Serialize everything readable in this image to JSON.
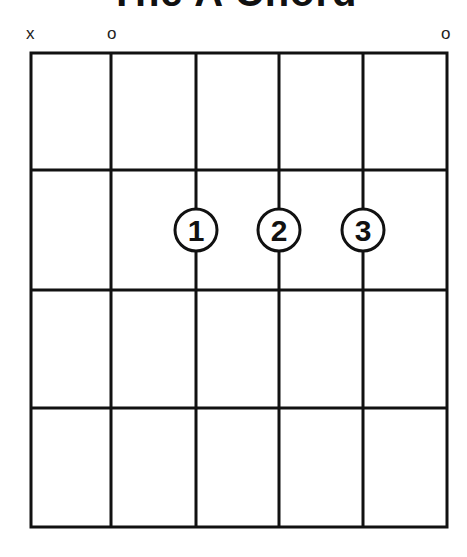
{
  "title": "The A Chord",
  "string_markers": [
    {
      "string": 6,
      "symbol": "x",
      "meaning": "muted"
    },
    {
      "string": 5,
      "symbol": "o",
      "meaning": "open"
    },
    {
      "string": 1,
      "symbol": "o",
      "meaning": "open"
    }
  ],
  "fingers": [
    {
      "label": "1",
      "string": 4,
      "fret": 2
    },
    {
      "label": "2",
      "string": 3,
      "fret": 2
    },
    {
      "label": "3",
      "string": 2,
      "fret": 2
    }
  ],
  "grid": {
    "strings": 6,
    "frets": 4
  },
  "colors": {
    "line": "#111111",
    "background": "#ffffff"
  }
}
